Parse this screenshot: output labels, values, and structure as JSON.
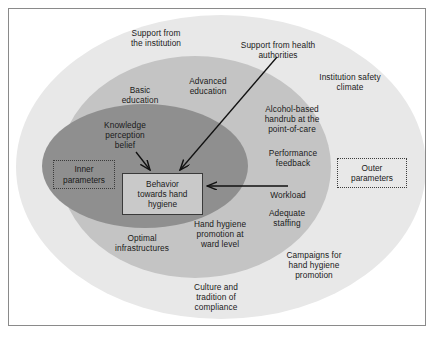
{
  "figure": {
    "colors": {
      "outer_ring": "#e8e8e8",
      "middle_ring": "#c4c4c4",
      "inner_ellipse": "#8f8f8f",
      "center_box_fill": "#c9c9c9",
      "frame_border": "#8a8a8a",
      "text": "#1a1a1a",
      "arrow": "#111111",
      "page_background": "#ffffff"
    }
  },
  "center": {
    "label": "Behavior\ntowards hand\nhygiene"
  },
  "parameter_boxes": [
    {
      "name": "inner",
      "label": "Inner\nparameters"
    },
    {
      "name": "outer",
      "label": "Outer\nparameters"
    }
  ],
  "outer_ring_labels": [
    {
      "key": "support-from-the-institution",
      "label": "Support from\nthe institution"
    },
    {
      "key": "support-from-health-authorities",
      "label": "Support from health\nauthorities"
    },
    {
      "key": "institution-safety-climate",
      "label": "Institution safety\nclimate"
    },
    {
      "key": "campaigns-for-hand-hygiene-promotion",
      "label": "Campaigns for\nhand hygiene\npromotion"
    },
    {
      "key": "culture-and-tradition-of-compliance",
      "label": "Culture and\ntradition of\ncompliance"
    }
  ],
  "middle_ring_labels": [
    {
      "key": "basic-education",
      "label": "Basic\neducation"
    },
    {
      "key": "advanced-education",
      "label": "Advanced\neducation"
    },
    {
      "key": "alcohol-based-handrub",
      "label": "Alcohol-based\nhandrub at the\npoint-of-care"
    },
    {
      "key": "performance-feedback",
      "label": "Performance\nfeedback"
    },
    {
      "key": "workload",
      "label": "Workload"
    },
    {
      "key": "adequate-staffing",
      "label": "Adequate\nstaffing"
    },
    {
      "key": "hand-hygiene-promotion-at-ward-level",
      "label": "Hand hygiene\npromotion at\nward level"
    },
    {
      "key": "optimal-infrastructures",
      "label": "Optimal\ninfrastructures"
    }
  ],
  "inner_ellipse_labels": [
    {
      "key": "knowledge-perception-belief",
      "label": "Knowledge\nperception\nbelief"
    }
  ],
  "arrows": [
    {
      "key": "knowledge-to-behavior",
      "from": "Knowledge perception belief",
      "to": "Behavior towards hand hygiene"
    },
    {
      "key": "health-authorities-to-behavior",
      "from": "Support from health authorities",
      "to": "Behavior towards hand hygiene"
    },
    {
      "key": "middle-ring-to-behavior",
      "from": "outer determinants",
      "to": "Behavior towards hand hygiene"
    }
  ]
}
